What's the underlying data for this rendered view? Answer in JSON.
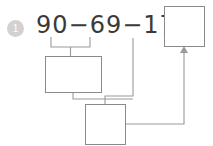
{
  "worksheet": {
    "problem_number": "1",
    "equation": "90−69−17=",
    "answer_box_value": "",
    "work_box_1_value": "",
    "work_box_2_value": "",
    "colors": {
      "badge_fill": "#d2d2d2",
      "badge_text": "#ffffff",
      "ink": "#3a3a3a",
      "box_border": "#8a8a8a",
      "connector": "#9a9a9a",
      "background": "#ffffff"
    },
    "connectors": {
      "bracket_label": "bracket-under-90-minus-69",
      "line_from_17_label": "connector-from-17",
      "line_box1_to_box2_label": "connector-box1-to-box2",
      "line_box2_to_answer_label": "connector-box2-to-answer",
      "arrow_label": "arrowhead-into-answer-box"
    }
  }
}
